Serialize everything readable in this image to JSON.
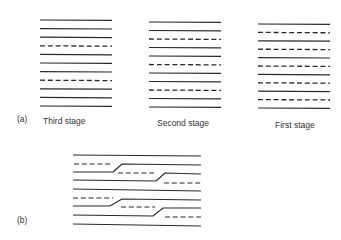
{
  "figure": {
    "line_color": "#2a2a2a",
    "background": "#ffffff",
    "part_a": {
      "label": "(a)",
      "label_pos": [
        17,
        114
      ],
      "panels": [
        {
          "name": "third-stage",
          "caption": "Third stage",
          "caption_pos": [
            43,
            116
          ],
          "x_start": 40,
          "x_end": 112,
          "y_start": 20,
          "spacing": 8.6,
          "pattern": [
            "solid",
            "solid",
            "solid",
            "dashed",
            "solid",
            "solid",
            "solid",
            "dashed",
            "solid",
            "solid",
            "solid"
          ]
        },
        {
          "name": "second-stage",
          "caption": "Second stage",
          "caption_pos": [
            157,
            118
          ],
          "x_start": 149,
          "x_end": 221,
          "y_start": 22,
          "spacing": 8.5,
          "pattern": [
            "solid",
            "solid",
            "dashed",
            "solid",
            "solid",
            "dashed",
            "solid",
            "solid",
            "dashed",
            "solid",
            "solid"
          ]
        },
        {
          "name": "first-stage",
          "caption": "First  stage",
          "caption_pos": [
            275,
            120
          ],
          "x_start": 258,
          "x_end": 330,
          "y_start": 24,
          "spacing": 8.4,
          "pattern": [
            "solid",
            "dashed",
            "solid",
            "dashed",
            "solid",
            "dashed",
            "solid",
            "dashed",
            "solid",
            "dashed",
            "solid"
          ]
        }
      ]
    },
    "part_b": {
      "label": "(b)",
      "label_pos": [
        17,
        215
      ],
      "segments": [
        {
          "type": "solid",
          "points": [
            [
              73,
              155
            ],
            [
              201,
              156
            ]
          ]
        },
        {
          "type": "dashed",
          "points": [
            [
              74,
              164
            ],
            [
              113,
              164
            ]
          ]
        },
        {
          "type": "solid",
          "points": [
            [
              73,
              172
            ],
            [
              113,
              172
            ],
            [
              122,
              164
            ],
            [
              201,
              165
            ]
          ]
        },
        {
          "type": "dashed",
          "points": [
            [
              118,
              173
            ],
            [
              157,
              173
            ]
          ]
        },
        {
          "type": "solid",
          "points": [
            [
              73,
              180
            ],
            [
              156,
              181
            ],
            [
              165,
              173
            ],
            [
              201,
              174
            ]
          ]
        },
        {
          "type": "dashed",
          "points": [
            [
              164,
              183
            ],
            [
              201,
              183
            ]
          ]
        },
        {
          "type": "solid",
          "points": [
            [
              73,
              189
            ],
            [
              201,
              191
            ]
          ]
        },
        {
          "type": "dashed",
          "points": [
            [
              73,
              198
            ],
            [
              113,
              198
            ]
          ]
        },
        {
          "type": "solid",
          "points": [
            [
              73,
              206
            ],
            [
              110,
              206
            ],
            [
              122,
              199
            ],
            [
              201,
              200
            ]
          ]
        },
        {
          "type": "dashed",
          "points": [
            [
              121,
              207
            ],
            [
              155,
              207
            ]
          ]
        },
        {
          "type": "solid",
          "points": [
            [
              73,
              215
            ],
            [
              153,
              216
            ],
            [
              163,
              208
            ],
            [
              201,
              208
            ]
          ]
        },
        {
          "type": "dashed",
          "points": [
            [
              165,
              217
            ],
            [
              201,
              217
            ]
          ]
        },
        {
          "type": "solid",
          "points": [
            [
              73,
              224
            ],
            [
              201,
              226
            ]
          ]
        }
      ]
    }
  }
}
